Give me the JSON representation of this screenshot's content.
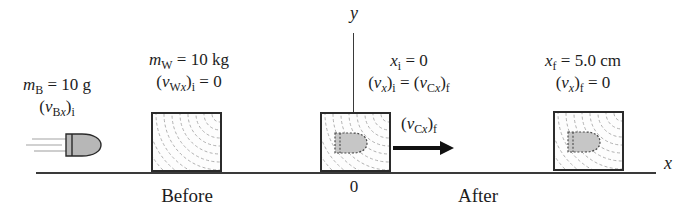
{
  "figure": {
    "colors": {
      "background": "#ffffff",
      "ink": "#1c1c1c",
      "line": "#3a3a3a",
      "bullet_fill": "#b7b7b7",
      "embedded_bullet_fill": "#c6c6c6",
      "wood_grain": "#9d9d9d",
      "speed_lines": "#c2c2c2"
    },
    "axis": {
      "x_label": [
        [
          "i",
          "x"
        ]
      ],
      "y_label": [
        [
          "i",
          "y"
        ]
      ],
      "origin_label": "0"
    },
    "before": {
      "caption": "Before",
      "bullet_mass": [
        [
          "i",
          "m"
        ],
        [
          "sub",
          "B"
        ],
        [
          "n",
          " = 10 g"
        ]
      ],
      "bullet_velocity": [
        [
          "n",
          "("
        ],
        [
          "i",
          "v"
        ],
        [
          "sub",
          "B"
        ],
        [
          "subi",
          "x"
        ],
        [
          "n",
          ")"
        ],
        [
          "sub",
          "i"
        ]
      ],
      "block_mass": [
        [
          "i",
          "m"
        ],
        [
          "sub",
          "W"
        ],
        [
          "n",
          " = 10 kg"
        ]
      ],
      "block_velocity": [
        [
          "n",
          "("
        ],
        [
          "i",
          "v"
        ],
        [
          "sub",
          "W"
        ],
        [
          "subi",
          "x"
        ],
        [
          "n",
          ")"
        ],
        [
          "sub",
          "i"
        ],
        [
          "n",
          " = 0"
        ]
      ]
    },
    "after": {
      "caption": "After",
      "x_initial": [
        [
          "i",
          "x"
        ],
        [
          "sub",
          "i"
        ],
        [
          "n",
          " = 0"
        ]
      ],
      "v_initial_equation": [
        [
          "n",
          "("
        ],
        [
          "i",
          "v"
        ],
        [
          "subi",
          "x"
        ],
        [
          "n",
          ")"
        ],
        [
          "sub",
          "i"
        ],
        [
          "n",
          " = ("
        ],
        [
          "i",
          "v"
        ],
        [
          "sub",
          "C"
        ],
        [
          "subi",
          "x"
        ],
        [
          "n",
          ")"
        ],
        [
          "sub",
          "f"
        ]
      ],
      "arrow_label": [
        [
          "n",
          "("
        ],
        [
          "i",
          "v"
        ],
        [
          "sub",
          "C"
        ],
        [
          "subi",
          "x"
        ],
        [
          "n",
          ")"
        ],
        [
          "sub",
          "f"
        ]
      ],
      "x_final": [
        [
          "i",
          "x"
        ],
        [
          "sub",
          "f"
        ],
        [
          "n",
          " = 5.0 cm"
        ]
      ],
      "v_final": [
        [
          "n",
          "("
        ],
        [
          "i",
          "v"
        ],
        [
          "subi",
          "x"
        ],
        [
          "n",
          ")"
        ],
        [
          "sub",
          "f"
        ],
        [
          "n",
          " = 0"
        ]
      ]
    }
  }
}
